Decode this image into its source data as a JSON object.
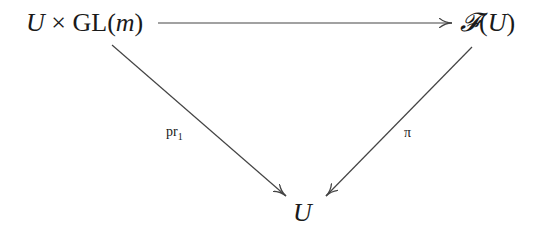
{
  "diagram": {
    "type": "commutative-diagram",
    "nodes": {
      "top_left": {
        "var": "U",
        "times": "×",
        "group": "GL",
        "open": "(",
        "arg": "m",
        "close": ")"
      },
      "top_right": {
        "functor": "𝓕",
        "open": "(",
        "arg": "U",
        "close": ")"
      },
      "bottom": {
        "var": "U"
      }
    },
    "arrows": [
      {
        "from": "top_left",
        "to": "top_right",
        "label": ""
      },
      {
        "from": "top_left",
        "to": "bottom",
        "label_base": "pr",
        "label_sub": "1"
      },
      {
        "from": "top_right",
        "to": "bottom",
        "label": "π"
      }
    ],
    "line_color": "#444444"
  }
}
